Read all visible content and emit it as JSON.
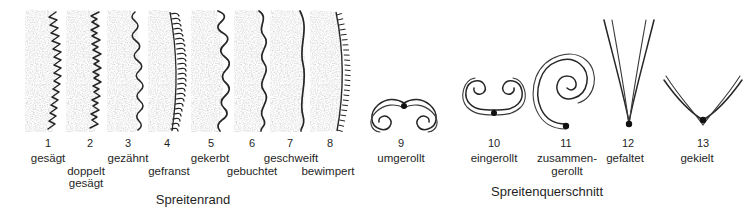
{
  "figure": {
    "title_left": "Spreitenrand",
    "title_right": "Spreitenquerschnitt",
    "leaf_margins": [
      {
        "number": "1",
        "label": "gesägt",
        "label2": "",
        "type": "serrate"
      },
      {
        "number": "2",
        "label": "doppelt",
        "label2": "gesägt",
        "type": "doubly-serrate"
      },
      {
        "number": "3",
        "label": "gezähnt",
        "label2": "",
        "type": "dentate"
      },
      {
        "number": "4",
        "label": "gefranst",
        "label2": "",
        "type": "fringed"
      },
      {
        "number": "5",
        "label": "gekerbt",
        "label2": "",
        "type": "crenate"
      },
      {
        "number": "6",
        "label": "gebuchtet",
        "label2": "",
        "type": "sinuate"
      },
      {
        "number": "7",
        "label": "geschweift",
        "label2": "",
        "type": "undulate"
      },
      {
        "number": "8",
        "label": "bewimpert",
        "label2": "",
        "type": "ciliate"
      }
    ],
    "cross_sections": [
      {
        "number": "9",
        "label": "umgerollt",
        "label2": "",
        "type": "revolute"
      },
      {
        "number": "10",
        "label": "eingerollt",
        "label2": "",
        "type": "involute"
      },
      {
        "number": "11",
        "label": "zusammen-",
        "label2": "gerollt",
        "type": "convolute"
      },
      {
        "number": "12",
        "label": "gefaltet",
        "label2": "",
        "type": "conduplicate"
      },
      {
        "number": "13",
        "label": "gekielt",
        "label2": "",
        "type": "keeled"
      }
    ]
  },
  "colors": {
    "ink": "#1a1a1a",
    "stipple": "#9a9a9a",
    "background": "#ffffff"
  }
}
